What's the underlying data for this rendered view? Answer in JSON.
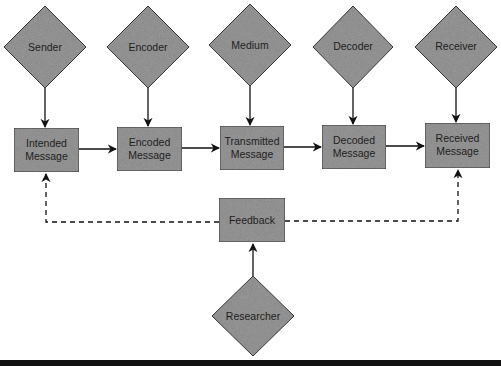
{
  "diagram": {
    "title": "",
    "colors": {
      "node_fill": "#9a9a9a",
      "node_stroke": "#3a3a3a",
      "arrow": "#111111",
      "text": "#1e1e1e",
      "bottom_rule": "#111111"
    },
    "sources": [
      {
        "id": "sender",
        "label": "Sender"
      },
      {
        "id": "encoder",
        "label": "Encoder"
      },
      {
        "id": "medium",
        "label": "Medium"
      },
      {
        "id": "decoder",
        "label": "Decoder"
      },
      {
        "id": "receiver",
        "label": "Receiver"
      }
    ],
    "messages": [
      {
        "id": "intended",
        "line1": "Intended",
        "line2": "Message"
      },
      {
        "id": "encoded",
        "line1": "Encoded",
        "line2": "Message"
      },
      {
        "id": "transmitted",
        "line1": "Transmitted",
        "line2": "Message"
      },
      {
        "id": "decoded",
        "line1": "Decoded",
        "line2": "Message"
      },
      {
        "id": "received",
        "line1": "Received",
        "line2": "Message"
      }
    ],
    "feedback": {
      "label": "Feedback"
    },
    "researcher": {
      "label": "Researcher"
    },
    "edges": [
      {
        "from": "Sender",
        "to": "Intended Message",
        "style": "solid"
      },
      {
        "from": "Encoder",
        "to": "Encoded Message",
        "style": "solid"
      },
      {
        "from": "Medium",
        "to": "Transmitted Message",
        "style": "solid"
      },
      {
        "from": "Decoder",
        "to": "Decoded Message",
        "style": "solid"
      },
      {
        "from": "Receiver",
        "to": "Received Message",
        "style": "solid"
      },
      {
        "from": "Intended Message",
        "to": "Encoded Message",
        "style": "solid"
      },
      {
        "from": "Encoded Message",
        "to": "Transmitted Message",
        "style": "solid"
      },
      {
        "from": "Transmitted Message",
        "to": "Decoded Message",
        "style": "solid"
      },
      {
        "from": "Decoded Message",
        "to": "Received Message",
        "style": "solid"
      },
      {
        "from": "Researcher",
        "to": "Feedback",
        "style": "solid"
      },
      {
        "from": "Feedback",
        "to": "Intended Message",
        "style": "dashed"
      },
      {
        "from": "Feedback",
        "to": "Received Message",
        "style": "dashed"
      }
    ]
  }
}
